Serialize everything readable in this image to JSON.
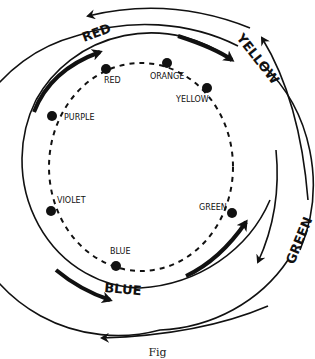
{
  "diagram": {
    "type": "color-wheel-cycle",
    "inner_circle": {
      "style": "dashed",
      "points": [
        {
          "label": "RED",
          "x": 106,
          "y": 69,
          "lx": 104,
          "ly": 83
        },
        {
          "label": "ORANGE",
          "x": 167,
          "y": 63,
          "lx": 150,
          "ly": 78
        },
        {
          "label": "YELLOW",
          "x": 207,
          "y": 88,
          "lx": 176,
          "ly": 102
        },
        {
          "label": "PURPLE",
          "x": 52,
          "y": 116,
          "lx": 64,
          "ly": 120
        },
        {
          "label": "VIOLET",
          "x": 51,
          "y": 211,
          "lx": 57,
          "ly": 203
        },
        {
          "label": "GREEN",
          "x": 232,
          "y": 213,
          "lx": 199,
          "ly": 209
        },
        {
          "label": "BLUE",
          "x": 116,
          "y": 266,
          "lx": 110,
          "ly": 254
        }
      ]
    },
    "outer_labels": [
      {
        "label": "RED",
        "x": 96,
        "y": 38,
        "rotate": -20
      },
      {
        "label": "YELLOW",
        "x": 253,
        "y": 55,
        "rotate": 52
      },
      {
        "label": "GREEN",
        "x": 286,
        "y": 240,
        "rotate": -68
      },
      {
        "label": "BLUE",
        "x": 121,
        "y": 289,
        "rotate": 5
      }
    ]
  },
  "caption": "Fig"
}
